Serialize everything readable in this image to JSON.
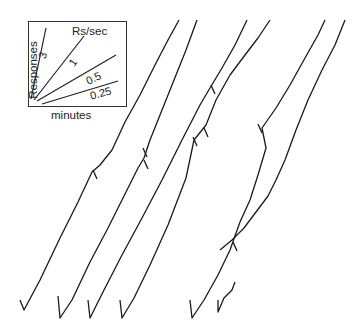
{
  "chart_data": {
    "type": "line",
    "title": "",
    "legend": {
      "title": "Rs/sec",
      "xlabel": "minutes",
      "ylabel": "Responses",
      "rate_lines": [
        "3",
        "1",
        "0.5",
        "0.25"
      ]
    },
    "series": [
      {
        "name": "record-1",
        "points": [
          [
            20,
            300
          ],
          [
            24,
            310
          ],
          [
            40,
            280
          ],
          [
            60,
            238
          ],
          [
            78,
            202
          ],
          [
            92,
            172
          ],
          [
            100,
            165
          ],
          [
            112,
            150
          ],
          [
            125,
            122
          ],
          [
            140,
            95
          ],
          [
            155,
            65
          ],
          [
            168,
            40
          ],
          [
            179,
            20
          ]
        ],
        "pips": [
          [
            93,
            170
          ]
        ]
      },
      {
        "name": "record-2",
        "points": [
          [
            58,
            296
          ],
          [
            60,
            318
          ],
          [
            72,
            300
          ],
          [
            90,
            262
          ],
          [
            108,
            228
          ],
          [
            122,
            200
          ],
          [
            138,
            168
          ],
          [
            144,
            158
          ],
          [
            150,
            140
          ],
          [
            160,
            115
          ],
          [
            172,
            85
          ],
          [
            186,
            50
          ],
          [
            197,
            20
          ]
        ],
        "pips": [
          [
            143,
            148
          ],
          [
            144,
            160
          ]
        ]
      },
      {
        "name": "record-3",
        "points": [
          [
            88,
            300
          ],
          [
            90,
            318
          ],
          [
            104,
            290
          ],
          [
            122,
            255
          ],
          [
            142,
            218
          ],
          [
            162,
            180
          ],
          [
            182,
            140
          ],
          [
            200,
            105
          ],
          [
            210,
            88
          ],
          [
            222,
            68
          ],
          [
            235,
            45
          ],
          [
            247,
            20
          ]
        ],
        "pips": [
          [
            211,
            85
          ]
        ]
      },
      {
        "name": "record-4",
        "points": [
          [
            120,
            300
          ],
          [
            122,
            318
          ],
          [
            134,
            298
          ],
          [
            150,
            265
          ],
          [
            168,
            225
          ],
          [
            186,
            178
          ],
          [
            194,
            140
          ],
          [
            206,
            125
          ],
          [
            216,
            100
          ],
          [
            230,
            75
          ],
          [
            245,
            55
          ],
          [
            258,
            38
          ],
          [
            270,
            20
          ]
        ],
        "pips": [
          [
            193,
            137
          ],
          [
            204,
            128
          ]
        ]
      },
      {
        "name": "record-5",
        "points": [
          [
            190,
            300
          ],
          [
            192,
            318
          ],
          [
            204,
            300
          ],
          [
            218,
            275
          ],
          [
            230,
            250
          ],
          [
            240,
            222
          ],
          [
            250,
            200
          ],
          [
            258,
            175
          ],
          [
            266,
            148
          ],
          [
            262,
            128
          ],
          [
            276,
            108
          ],
          [
            290,
            85
          ],
          [
            305,
            58
          ],
          [
            318,
            35
          ],
          [
            325,
            20
          ]
        ],
        "pips": [
          [
            258,
            124
          ]
        ]
      },
      {
        "name": "record-6",
        "points": [
          [
            218,
            300
          ],
          [
            218,
            312
          ],
          [
            224,
            298
          ],
          [
            232,
            290
          ],
          [
            235,
            282
          ]
        ],
        "pips": []
      },
      {
        "name": "record-7",
        "points": [
          [
            220,
            250
          ],
          [
            232,
            240
          ],
          [
            244,
            228
          ],
          [
            256,
            212
          ],
          [
            268,
            196
          ],
          [
            276,
            180
          ],
          [
            285,
            160
          ],
          [
            296,
            130
          ],
          [
            308,
            100
          ],
          [
            322,
            70
          ],
          [
            335,
            45
          ],
          [
            345,
            20
          ]
        ],
        "pips": [
          [
            233,
            242
          ]
        ]
      }
    ]
  }
}
